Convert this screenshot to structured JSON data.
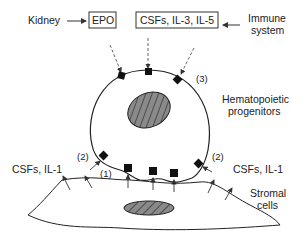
{
  "labels": {
    "kidney": "Kidney",
    "epo": "EPO",
    "csfs_il3_il5": "CSFs, IL-3, IL-5",
    "immune_line1": "Immune",
    "immune_line2": "system",
    "hemato_line1": "Hematopoietic",
    "hemato_line2": "progenitors",
    "csfs_il1_left": "CSFs, IL-1",
    "csfs_il1_right": "CSFs, IL-1",
    "stromal_line1": "Stromal",
    "stromal_line2": "cells",
    "marker1": "(1)",
    "marker2_left": "(2)",
    "marker2_right": "(2)",
    "marker3": "(3)"
  },
  "colors": {
    "line": "#222222",
    "nucleus_fill": "#8a8a8a",
    "receptor": "#111111"
  }
}
